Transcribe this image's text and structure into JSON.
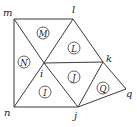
{
  "diagram": {
    "type": "triangulated-mesh",
    "vertices": [
      {
        "id": "m",
        "label": "m",
        "x": 14,
        "y": 19,
        "lx": 3,
        "ly": 16
      },
      {
        "id": "l",
        "label": "l",
        "x": 73,
        "y": 19,
        "lx": 72,
        "ly": 13
      },
      {
        "id": "k",
        "label": "k",
        "x": 103,
        "y": 62,
        "lx": 106,
        "ly": 62
      },
      {
        "id": "i",
        "label": "i",
        "x": 44,
        "y": 63,
        "lx": 40,
        "ly": 77
      },
      {
        "id": "n",
        "label": "n",
        "x": 14,
        "y": 107,
        "lx": 4,
        "ly": 116
      },
      {
        "id": "j",
        "label": "j",
        "x": 78,
        "y": 107,
        "lx": 74,
        "ly": 119
      },
      {
        "id": "q",
        "label": "q",
        "x": 126,
        "y": 89,
        "lx": 126,
        "ly": 97
      }
    ],
    "edges": [
      [
        "m",
        "l"
      ],
      [
        "m",
        "n"
      ],
      [
        "m",
        "i"
      ],
      [
        "l",
        "i"
      ],
      [
        "l",
        "k"
      ],
      [
        "i",
        "k"
      ],
      [
        "i",
        "n"
      ],
      [
        "i",
        "j"
      ],
      [
        "n",
        "j"
      ],
      [
        "j",
        "k"
      ],
      [
        "k",
        "q"
      ],
      [
        "j",
        "q"
      ]
    ],
    "faces": [
      {
        "label": "M",
        "x": 43,
        "y": 33
      },
      {
        "label": "L",
        "x": 74,
        "y": 48
      },
      {
        "label": "N",
        "x": 24,
        "y": 62
      },
      {
        "label": "J",
        "x": 74,
        "y": 77
      },
      {
        "label": "I",
        "x": 45,
        "y": 92
      },
      {
        "label": "Q",
        "x": 103,
        "y": 88
      }
    ]
  }
}
